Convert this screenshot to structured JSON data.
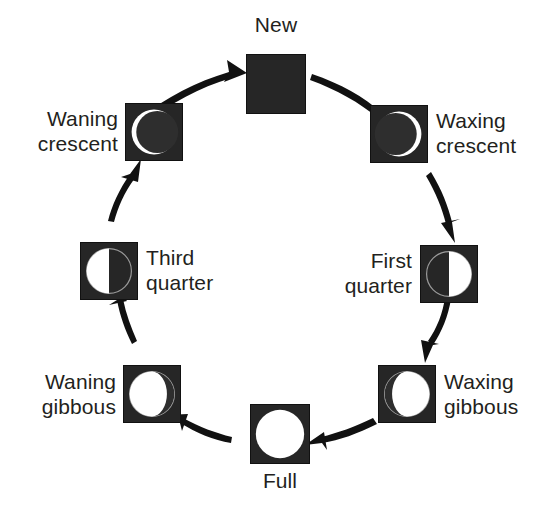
{
  "diagram": {
    "background_color": "#ffffff",
    "tile_background_color": "#262626",
    "lit_color": "#ffffff",
    "dark_color": "#2b2b2b",
    "outline_color": "#8c8c8c",
    "text_color": "#231f20",
    "arrow_color": "#111111",
    "flow_direction": "clockwise"
  },
  "phases": [
    {
      "id": "new",
      "label": "New",
      "illumination_percent": 0,
      "lit_side": "none",
      "label_position": "above",
      "angle_degrees": 0
    },
    {
      "id": "waxing-crescent",
      "label": "Waxing\ncrescent",
      "illumination_percent": 8,
      "lit_side": "right",
      "label_position": "right",
      "angle_degrees": 45
    },
    {
      "id": "first-quarter",
      "label": "First\nquarter",
      "illumination_percent": 50,
      "lit_side": "right",
      "label_position": "left",
      "angle_degrees": 90
    },
    {
      "id": "waxing-gibbous",
      "label": "Waxing\ngibbous",
      "illumination_percent": 88,
      "lit_side": "right",
      "label_position": "right",
      "angle_degrees": 135
    },
    {
      "id": "full",
      "label": "Full",
      "illumination_percent": 100,
      "lit_side": "all",
      "label_position": "below",
      "angle_degrees": 180
    },
    {
      "id": "waning-gibbous",
      "label": "Waning\ngibbous",
      "illumination_percent": 88,
      "lit_side": "left",
      "label_position": "left",
      "angle_degrees": 225
    },
    {
      "id": "third-quarter",
      "label": "Third\nquarter",
      "illumination_percent": 50,
      "lit_side": "left",
      "label_position": "right",
      "angle_degrees": 270
    },
    {
      "id": "waning-crescent",
      "label": "Waning\ncrescent",
      "illumination_percent": 8,
      "lit_side": "left",
      "label_position": "left",
      "angle_degrees": 315
    }
  ],
  "transitions": [
    {
      "from": "waning-crescent",
      "to": "new"
    },
    {
      "from": "new",
      "to": "waxing-crescent"
    },
    {
      "from": "waxing-crescent",
      "to": "first-quarter"
    },
    {
      "from": "first-quarter",
      "to": "waxing-gibbous"
    },
    {
      "from": "waxing-gibbous",
      "to": "full"
    },
    {
      "from": "full",
      "to": "waning-gibbous"
    },
    {
      "from": "waning-gibbous",
      "to": "third-quarter"
    },
    {
      "from": "third-quarter",
      "to": "waning-crescent"
    }
  ]
}
